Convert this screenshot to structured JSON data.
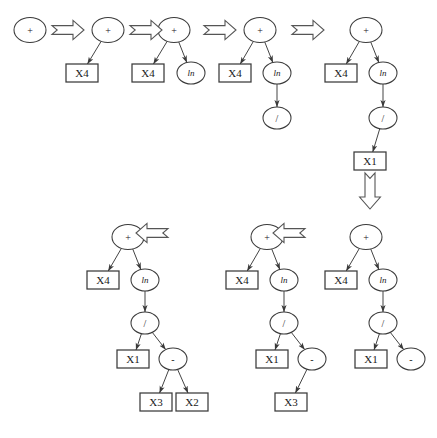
{
  "figure": {
    "background_color": "#ffffff",
    "stroke_color": "#3a3a3a",
    "arrow_color": "#555555",
    "node_labels": {
      "plus": "+",
      "ln": "ln",
      "divide": "/",
      "minus": "-",
      "x1": "X1",
      "x2": "X2",
      "x3": "X3",
      "x4": "X4"
    },
    "steps": [
      {
        "id": "step-1",
        "index": 1,
        "root": "+",
        "nodes": [
          {
            "name": "root-plus",
            "label": "+",
            "shape": "circle",
            "cx": 30,
            "cy": 30,
            "rx": 16,
            "ry": 12.5
          }
        ],
        "edges": []
      },
      {
        "id": "step-2",
        "index": 2,
        "root": "+",
        "nodes": [
          {
            "name": "root-plus",
            "label": "+",
            "shape": "circle",
            "cx": 108,
            "cy": 30,
            "rx": 16,
            "ry": 12.5
          },
          {
            "name": "leaf-x4",
            "label": "X4",
            "shape": "box",
            "x": 66,
            "y": 64,
            "w": 32,
            "h": 18
          }
        ],
        "edges": [
          {
            "from": "root-plus",
            "to": "leaf-x4"
          }
        ]
      },
      {
        "id": "step-3",
        "index": 3,
        "root": "+",
        "nodes": [
          {
            "name": "root-plus",
            "label": "+",
            "shape": "circle",
            "cx": 174,
            "cy": 30,
            "rx": 16,
            "ry": 12.5
          },
          {
            "name": "leaf-x4",
            "label": "X4",
            "shape": "box",
            "x": 132,
            "y": 64,
            "w": 32,
            "h": 18
          },
          {
            "name": "node-ln",
            "label": "ln",
            "shape": "circle",
            "cx": 191,
            "cy": 73,
            "rx": 14,
            "ry": 11
          }
        ],
        "edges": [
          {
            "from": "root-plus",
            "to": "leaf-x4"
          },
          {
            "from": "root-plus",
            "to": "node-ln"
          }
        ]
      },
      {
        "id": "step-4",
        "index": 4,
        "root": "+",
        "nodes": [
          {
            "name": "root-plus",
            "label": "+",
            "shape": "circle",
            "cx": 260,
            "cy": 30,
            "rx": 16,
            "ry": 12.5
          },
          {
            "name": "leaf-x4",
            "label": "X4",
            "shape": "box",
            "x": 219,
            "y": 64,
            "w": 32,
            "h": 18
          },
          {
            "name": "node-ln",
            "label": "ln",
            "shape": "circle",
            "cx": 277,
            "cy": 73,
            "rx": 14,
            "ry": 11
          },
          {
            "name": "node-divide",
            "label": "/",
            "shape": "circle",
            "cx": 277,
            "cy": 118,
            "rx": 14,
            "ry": 11
          }
        ],
        "edges": [
          {
            "from": "root-plus",
            "to": "leaf-x4"
          },
          {
            "from": "root-plus",
            "to": "node-ln"
          },
          {
            "from": "node-ln",
            "to": "node-divide"
          }
        ]
      },
      {
        "id": "step-5",
        "index": 5,
        "root": "+",
        "nodes": [
          {
            "name": "root-plus",
            "label": "+",
            "shape": "circle",
            "cx": 366,
            "cy": 30,
            "rx": 16,
            "ry": 12.5
          },
          {
            "name": "leaf-x4",
            "label": "X4",
            "shape": "box",
            "x": 325,
            "y": 64,
            "w": 32,
            "h": 18
          },
          {
            "name": "node-ln",
            "label": "ln",
            "shape": "circle",
            "cx": 383,
            "cy": 73,
            "rx": 14,
            "ry": 11
          },
          {
            "name": "node-divide",
            "label": "/",
            "shape": "circle",
            "cx": 383,
            "cy": 118,
            "rx": 14,
            "ry": 11
          },
          {
            "name": "leaf-x1",
            "label": "X1",
            "shape": "box",
            "x": 354,
            "y": 152,
            "w": 32,
            "h": 18
          }
        ],
        "edges": [
          {
            "from": "root-plus",
            "to": "leaf-x4"
          },
          {
            "from": "root-plus",
            "to": "node-ln"
          },
          {
            "from": "node-ln",
            "to": "node-divide"
          },
          {
            "from": "node-divide",
            "to": "leaf-x1"
          }
        ]
      },
      {
        "id": "step-6",
        "index": 6,
        "root": "+",
        "nodes": [
          {
            "name": "root-plus",
            "label": "+",
            "shape": "circle",
            "cx": 366,
            "cy": 237,
            "rx": 16,
            "ry": 12.5
          },
          {
            "name": "leaf-x4",
            "label": "X4",
            "shape": "box",
            "x": 325,
            "y": 271,
            "w": 32,
            "h": 18
          },
          {
            "name": "node-ln",
            "label": "ln",
            "shape": "circle",
            "cx": 383,
            "cy": 280,
            "rx": 14,
            "ry": 11
          },
          {
            "name": "node-divide",
            "label": "/",
            "shape": "circle",
            "cx": 383,
            "cy": 323,
            "rx": 14,
            "ry": 11
          },
          {
            "name": "leaf-x1",
            "label": "X1",
            "shape": "box",
            "x": 355,
            "y": 350,
            "w": 32,
            "h": 18
          },
          {
            "name": "node-minus",
            "label": "-",
            "shape": "circle",
            "cx": 411,
            "cy": 359,
            "rx": 14,
            "ry": 11
          }
        ],
        "edges": [
          {
            "from": "root-plus",
            "to": "leaf-x4"
          },
          {
            "from": "root-plus",
            "to": "node-ln"
          },
          {
            "from": "node-ln",
            "to": "node-divide"
          },
          {
            "from": "node-divide",
            "to": "leaf-x1"
          },
          {
            "from": "node-divide",
            "to": "node-minus"
          }
        ]
      },
      {
        "id": "step-7",
        "index": 7,
        "root": "+",
        "nodes": [
          {
            "name": "root-plus",
            "label": "+",
            "shape": "circle",
            "cx": 267,
            "cy": 237,
            "rx": 16,
            "ry": 12.5
          },
          {
            "name": "leaf-x4",
            "label": "X4",
            "shape": "box",
            "x": 226,
            "y": 271,
            "w": 32,
            "h": 18
          },
          {
            "name": "node-ln",
            "label": "ln",
            "shape": "circle",
            "cx": 284,
            "cy": 280,
            "rx": 14,
            "ry": 11
          },
          {
            "name": "node-divide",
            "label": "/",
            "shape": "circle",
            "cx": 284,
            "cy": 323,
            "rx": 14,
            "ry": 11
          },
          {
            "name": "leaf-x1",
            "label": "X1",
            "shape": "box",
            "x": 256,
            "y": 350,
            "w": 32,
            "h": 18
          },
          {
            "name": "node-minus",
            "label": "-",
            "shape": "circle",
            "cx": 312,
            "cy": 359,
            "rx": 14,
            "ry": 11
          },
          {
            "name": "leaf-x3",
            "label": "X3",
            "shape": "box",
            "x": 275,
            "y": 393,
            "w": 32,
            "h": 18
          }
        ],
        "edges": [
          {
            "from": "root-plus",
            "to": "leaf-x4"
          },
          {
            "from": "root-plus",
            "to": "node-ln"
          },
          {
            "from": "node-ln",
            "to": "node-divide"
          },
          {
            "from": "node-divide",
            "to": "leaf-x1"
          },
          {
            "from": "node-divide",
            "to": "node-minus"
          },
          {
            "from": "node-minus",
            "to": "leaf-x3"
          }
        ]
      },
      {
        "id": "step-8",
        "index": 8,
        "root": "+",
        "nodes": [
          {
            "name": "root-plus",
            "label": "+",
            "shape": "circle",
            "cx": 128,
            "cy": 237,
            "rx": 16,
            "ry": 12.5
          },
          {
            "name": "leaf-x4",
            "label": "X4",
            "shape": "box",
            "x": 87,
            "y": 271,
            "w": 32,
            "h": 18
          },
          {
            "name": "node-ln",
            "label": "ln",
            "shape": "circle",
            "cx": 145,
            "cy": 280,
            "rx": 14,
            "ry": 11
          },
          {
            "name": "node-divide",
            "label": "/",
            "shape": "circle",
            "cx": 145,
            "cy": 323,
            "rx": 14,
            "ry": 11
          },
          {
            "name": "leaf-x1",
            "label": "X1",
            "shape": "box",
            "x": 117,
            "y": 350,
            "w": 32,
            "h": 18
          },
          {
            "name": "node-minus",
            "label": "-",
            "shape": "circle",
            "cx": 173,
            "cy": 359,
            "rx": 14,
            "ry": 11
          },
          {
            "name": "leaf-x3",
            "label": "X3",
            "shape": "box",
            "x": 140,
            "y": 393,
            "w": 32,
            "h": 18
          },
          {
            "name": "leaf-x2",
            "label": "X2",
            "shape": "box",
            "x": 176,
            "y": 393,
            "w": 32,
            "h": 18
          }
        ],
        "edges": [
          {
            "from": "root-plus",
            "to": "leaf-x4"
          },
          {
            "from": "root-plus",
            "to": "node-ln"
          },
          {
            "from": "node-ln",
            "to": "node-divide"
          },
          {
            "from": "node-divide",
            "to": "leaf-x1"
          },
          {
            "from": "node-divide",
            "to": "node-minus"
          },
          {
            "from": "node-minus",
            "to": "leaf-x3"
          },
          {
            "from": "node-minus",
            "to": "leaf-x2"
          }
        ]
      }
    ],
    "transition_arrows": [
      {
        "name": "arrow-step1-to-step2",
        "direction": "right",
        "x": 52,
        "y": 30
      },
      {
        "name": "arrow-step2-to-step3",
        "direction": "right",
        "x": 130,
        "y": 30
      },
      {
        "name": "arrow-step3-to-step4",
        "direction": "right",
        "x": 204,
        "y": 30
      },
      {
        "name": "arrow-step4-to-step5",
        "direction": "right",
        "x": 292,
        "y": 30
      },
      {
        "name": "arrow-step5-to-step6",
        "direction": "down",
        "x": 370,
        "y": 173
      },
      {
        "name": "arrow-step6-to-step7",
        "direction": "left",
        "x": 305,
        "y": 233
      },
      {
        "name": "arrow-step7-to-step8",
        "direction": "left",
        "x": 168,
        "y": 233
      }
    ]
  }
}
